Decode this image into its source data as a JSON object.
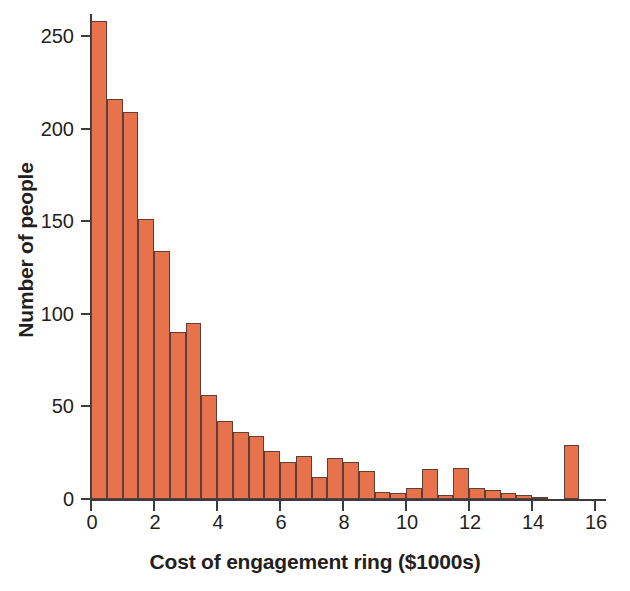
{
  "chart_data": {
    "type": "bar",
    "title": "",
    "xlabel": "Cost of engagement ring ($1000s)",
    "ylabel": "Number of people",
    "xlim": [
      0,
      16.8
    ],
    "ylim": [
      0,
      268
    ],
    "grid": false,
    "legend": null,
    "bin_width": 0.5,
    "xticks": [
      0,
      2,
      4,
      6,
      8,
      10,
      12,
      14,
      16
    ],
    "xtick_labels": [
      "0",
      "2",
      "4",
      "6",
      "8",
      "10",
      "12",
      "14",
      "16"
    ],
    "yticks": [
      0,
      50,
      100,
      150,
      200,
      250
    ],
    "ytick_labels": [
      "0",
      "50",
      "100",
      "150",
      "200",
      "250"
    ],
    "bar_color": "#e8724c",
    "bar_edge_color": "#5c4038",
    "axis_color": "#3b3b3b",
    "text_color": "#231f20",
    "categories": [
      "0.0-0.5",
      "0.5-1.0",
      "1.0-1.5",
      "1.5-2.0",
      "2.0-2.5",
      "2.5-3.0",
      "3.0-3.5",
      "3.5-4.0",
      "4.0-4.5",
      "4.5-5.0",
      "5.0-5.5",
      "5.5-6.0",
      "6.0-6.5",
      "6.5-7.0",
      "7.0-7.5",
      "7.5-8.0",
      "8.0-8.5",
      "8.5-9.0",
      "9.0-9.5",
      "9.5-10.0",
      "10.0-10.5",
      "10.5-11.0",
      "11.0-11.5",
      "11.5-12.0",
      "12.0-12.5",
      "12.5-13.0",
      "13.0-13.5",
      "13.5-14.0",
      "14.0-14.5",
      "14.5-15.0",
      "15.0-15.5"
    ],
    "bin_starts": [
      0.0,
      0.5,
      1.0,
      1.5,
      2.0,
      2.5,
      3.0,
      3.5,
      4.0,
      4.5,
      5.0,
      5.5,
      6.0,
      6.5,
      7.0,
      7.5,
      8.0,
      8.5,
      9.0,
      9.5,
      10.0,
      10.5,
      11.0,
      11.5,
      12.0,
      12.5,
      13.0,
      13.5,
      14.0,
      14.5,
      15.0
    ],
    "values": [
      258,
      216,
      209,
      151,
      134,
      90,
      95,
      56,
      42,
      36,
      34,
      26,
      20,
      23,
      12,
      22,
      20,
      15,
      4,
      3,
      6,
      16,
      2,
      17,
      6,
      5,
      3,
      2,
      1,
      0,
      29
    ]
  }
}
